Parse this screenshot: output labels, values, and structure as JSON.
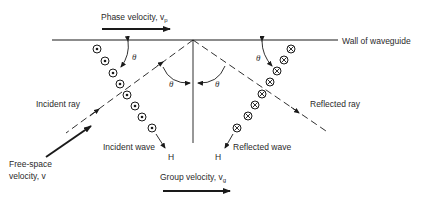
{
  "diagram": {
    "type": "waveguide-reflection",
    "labels": {
      "phase_velocity": "Phase velocity, v",
      "phase_velocity_sub": "p",
      "wall": "Wall of waveguide",
      "incident_ray": "Incident ray",
      "reflected_ray": "Reflected ray",
      "incident_wave": "Incident wave",
      "reflected_wave": "Reflected wave",
      "free_space_line1": "Free-space",
      "free_space_line2": "velocity, v",
      "group_velocity": "Group velocity, v",
      "group_velocity_sub": "g",
      "h_incident": "H",
      "h_reflected": "H",
      "theta": "θ"
    },
    "incident_field_symbols": {
      "symbol": "dot-in-circle (out of page)",
      "count": 8
    },
    "reflected_field_symbols": {
      "symbol": "cross-in-circle (into page)",
      "count": 8
    },
    "colors": {
      "line": "#1a1a1a",
      "text": "#2a2a2a",
      "background": "#ffffff"
    }
  }
}
